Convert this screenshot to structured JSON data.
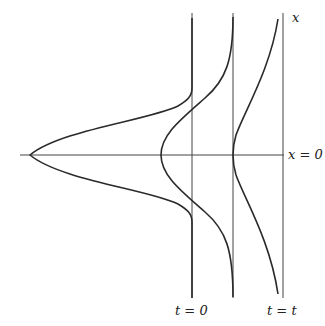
{
  "labels": {
    "x_axis_label": "x",
    "x_zero_label": "x = 0",
    "t0_label": "t = 0",
    "tt_label": "t = t"
  },
  "colors": {
    "line": "#333333",
    "curve": "#2a2a2a",
    "background": "#ffffff"
  }
}
